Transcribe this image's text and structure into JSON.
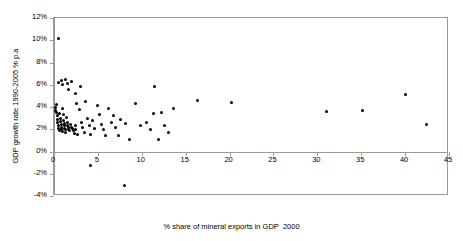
{
  "chart_data": {
    "type": "scatter",
    "title": "",
    "xlabel": "% share of mineral exports in GDP  2000",
    "ylabel": "GDP growth rate 1990-2005 % p.a",
    "xlim": [
      0,
      45
    ],
    "ylim": [
      -4,
      12
    ],
    "xticks": [
      0,
      5,
      10,
      15,
      20,
      25,
      30,
      35,
      40,
      45
    ],
    "xtick_labels": [
      "0",
      "5",
      "10",
      "15",
      "20",
      "25",
      "30",
      "35",
      "40",
      "45"
    ],
    "yticks": [
      -4,
      -2,
      0,
      2,
      4,
      6,
      8,
      10,
      12
    ],
    "ytick_labels": [
      "-4%",
      "-2%",
      "0%",
      "2%",
      "4%",
      "6%",
      "8%",
      "10%",
      "12%"
    ],
    "grid": false,
    "legend": null,
    "marker": {
      "shape": "circle",
      "color": "#000000",
      "size": 3
    },
    "series": [
      {
        "name": "Countries",
        "color": "#000000",
        "points": [
          [
            0.55,
            10.2
          ],
          [
            0.5,
            6.2
          ],
          [
            0.9,
            6.4
          ],
          [
            1.0,
            6.0
          ],
          [
            1.3,
            6.5
          ],
          [
            1.5,
            6.1
          ],
          [
            2.0,
            6.3
          ],
          [
            1.6,
            5.6
          ],
          [
            3.0,
            5.8
          ],
          [
            2.5,
            5.2
          ],
          [
            11.4,
            5.8
          ],
          [
            40.0,
            5.1
          ],
          [
            0.15,
            4.0
          ],
          [
            0.2,
            3.7
          ],
          [
            0.25,
            3.5
          ],
          [
            0.3,
            4.2
          ],
          [
            0.35,
            3.2
          ],
          [
            0.4,
            2.9
          ],
          [
            0.45,
            2.6
          ],
          [
            0.5,
            2.3
          ],
          [
            0.55,
            2.1
          ],
          [
            0.6,
            1.9
          ],
          [
            0.65,
            3.4
          ],
          [
            0.7,
            3.0
          ],
          [
            0.75,
            2.7
          ],
          [
            0.8,
            2.4
          ],
          [
            0.85,
            2.2
          ],
          [
            0.9,
            2.0
          ],
          [
            0.95,
            1.8
          ],
          [
            1.0,
            3.9
          ],
          [
            1.05,
            3.3
          ],
          [
            1.1,
            2.8
          ],
          [
            1.15,
            2.5
          ],
          [
            1.2,
            2.3
          ],
          [
            1.25,
            2.1
          ],
          [
            1.3,
            1.95
          ],
          [
            1.35,
            1.7
          ],
          [
            1.4,
            3.1
          ],
          [
            1.5,
            2.6
          ],
          [
            1.55,
            2.35
          ],
          [
            1.6,
            2.15
          ],
          [
            1.7,
            2.0
          ],
          [
            1.8,
            1.85
          ],
          [
            1.9,
            2.45
          ],
          [
            2.0,
            2.2
          ],
          [
            2.1,
            2.05
          ],
          [
            2.2,
            1.9
          ],
          [
            2.3,
            1.6
          ],
          [
            2.4,
            2.3
          ],
          [
            2.5,
            2.0
          ],
          [
            2.6,
            4.3
          ],
          [
            2.7,
            1.5
          ],
          [
            2.9,
            3.8
          ],
          [
            3.1,
            2.6
          ],
          [
            3.3,
            2.2
          ],
          [
            3.5,
            1.75
          ],
          [
            3.6,
            4.5
          ],
          [
            3.8,
            3.0
          ],
          [
            4.0,
            2.35
          ],
          [
            4.2,
            1.55
          ],
          [
            4.4,
            2.8
          ],
          [
            4.6,
            2.1
          ],
          [
            5.0,
            4.1
          ],
          [
            5.2,
            3.35
          ],
          [
            5.4,
            2.45
          ],
          [
            5.6,
            1.95
          ],
          [
            5.9,
            1.45
          ],
          [
            6.2,
            3.9
          ],
          [
            6.5,
            2.6
          ],
          [
            6.8,
            3.2
          ],
          [
            7.0,
            2.15
          ],
          [
            7.3,
            1.4
          ],
          [
            7.6,
            2.9
          ],
          [
            8.2,
            2.5
          ],
          [
            8.6,
            1.05
          ],
          [
            9.3,
            4.35
          ],
          [
            9.8,
            2.3
          ],
          [
            10.5,
            2.6
          ],
          [
            11.0,
            2.0
          ],
          [
            11.3,
            3.45
          ],
          [
            12.2,
            3.5
          ],
          [
            12.6,
            2.3
          ],
          [
            13.6,
            3.85
          ],
          [
            16.3,
            4.55
          ],
          [
            20.2,
            4.4
          ],
          [
            13.0,
            1.75
          ],
          [
            11.9,
            1.05
          ],
          [
            31.1,
            3.6
          ],
          [
            35.2,
            3.7
          ],
          [
            42.4,
            2.4
          ],
          [
            4.2,
            -1.3
          ],
          [
            8.0,
            -3.1
          ]
        ]
      }
    ]
  }
}
